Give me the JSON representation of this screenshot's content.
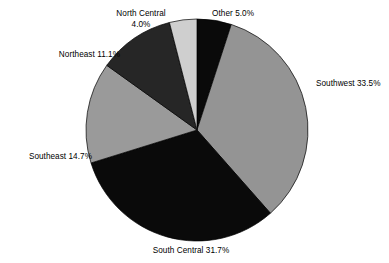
{
  "chart_data": {
    "type": "pie",
    "title": "",
    "subtitle": "",
    "xlabel": "",
    "ylabel": "",
    "legend_position": "none",
    "grid": false,
    "start_angle_deg": 0,
    "direction": "clockwise",
    "categories": [
      "Other",
      "Southwest",
      "South Central",
      "Southeast",
      "Northeast",
      "North Central"
    ],
    "values": [
      5.0,
      33.5,
      31.7,
      14.7,
      11.1,
      4.0
    ],
    "value_unit": "%",
    "slices": [
      {
        "name": "Other",
        "label": "Other 5.0%",
        "value": 5.0,
        "color": "#0a0a0a",
        "label_position": "top-right"
      },
      {
        "name": "Southwest",
        "label": "Southwest 33.5%",
        "value": 33.5,
        "color": "#949494",
        "label_position": "right"
      },
      {
        "name": "South Central",
        "label": "South Central 31.7%",
        "value": 31.7,
        "color": "#0a0a0a",
        "label_position": "bottom"
      },
      {
        "name": "Southeast",
        "label": "Southeast 14.7%",
        "value": 14.7,
        "color": "#9a9a9a",
        "label_position": "left"
      },
      {
        "name": "Northeast",
        "label": "Northeast 11.1%",
        "value": 11.1,
        "color": "#262626",
        "label_position": "upper-left"
      },
      {
        "name": "North Central",
        "label": "North Central 4.0%",
        "value": 4.0,
        "color": "#cfcfcf",
        "label_position": "top"
      }
    ]
  },
  "labels": {
    "north_central_line1": "North Central",
    "north_central_line2": "4.0%",
    "other": "Other 5.0%",
    "northeast": "Northeast 11.1%",
    "southeast": "Southeast 14.7%",
    "southwest": "Southwest 33.5%",
    "south_central": "South Central 31.7%"
  },
  "geometry": {
    "center_x": 197,
    "center_y": 130,
    "radius": 111
  },
  "colors": {
    "background": "#ffffff",
    "text": "#000000",
    "black_slice": "#0a0a0a",
    "dark_gray_slice": "#262626",
    "medium_gray_slice": "#949494",
    "medium_gray_slice_alt": "#9a9a9a",
    "light_gray_slice": "#cfcfcf",
    "slice_outline": "#000000"
  }
}
